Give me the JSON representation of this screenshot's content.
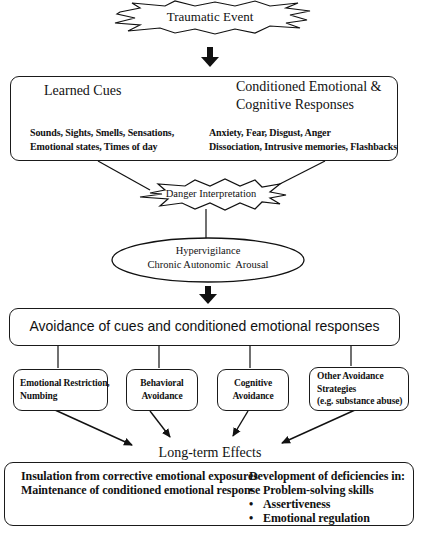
{
  "diagram": {
    "traumatic_event": "Traumatic Event",
    "learned_cues": {
      "title": "Learned Cues",
      "examples_line1": "Sounds, Sights, Smells, Sensations,",
      "examples_line2": "Emotional states, Times of day"
    },
    "conditioned_responses": {
      "title_line1": "Conditioned Emotional &",
      "title_line2": "Cognitive Responses",
      "examples_line1": "Anxiety, Fear, Disgust, Anger",
      "examples_line2": "Dissociation, Intrusive memories, Flashbacks"
    },
    "danger_interpretation": "Danger Interpretation",
    "hypervigilance": {
      "line1": "Hypervigilance",
      "line2": "Chronic Autonomic  Arousal"
    },
    "avoidance": "Avoidance of cues and conditioned emotional responses",
    "strategies": [
      {
        "line1": "Emotional Restriction,",
        "line2": "Numbing"
      },
      {
        "line1": "Behavioral",
        "line2": "Avoidance"
      },
      {
        "line1": "Cognitive",
        "line2": "Avoidance"
      },
      {
        "line1": "Other Avoidance",
        "line2": "Strategies",
        "line3": "(e.g. substance abuse)"
      }
    ],
    "long_term_effects": {
      "title": "Long-term Effects",
      "left_line1": "Insulation from corrective emotional exposures",
      "left_line2": "Maintenance of conditioned emotional response",
      "right_heading": "Development of deficiencies in:",
      "deficiencies": [
        "Problem-solving skills",
        "Assertiveness",
        "Emotional regulation"
      ]
    }
  }
}
